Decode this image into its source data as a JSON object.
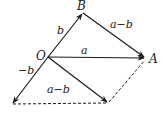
{
  "diagram": {
    "title": "",
    "points": {
      "O": {
        "label": "O",
        "x": 48,
        "y": 57
      },
      "A": {
        "label": "A",
        "x": 145,
        "y": 58
      },
      "B": {
        "label": "B",
        "x": 83,
        "y": 13
      },
      "neg_b_tip": {
        "x": 12,
        "y": 104
      },
      "a_minus_b_tip": {
        "x": 108,
        "y": 103
      }
    },
    "vectors": [
      {
        "from": "O",
        "to": "B",
        "label": "b",
        "style": "solid"
      },
      {
        "from": "O",
        "to": "A",
        "label": "a",
        "style": "solid"
      },
      {
        "from": "B",
        "to": "A",
        "label": "a−b",
        "style": "solid"
      },
      {
        "from": "O",
        "to": "neg_b_tip",
        "label": "−b",
        "style": "solid"
      },
      {
        "from": "O",
        "to": "a_minus_b_tip",
        "label": "a−b",
        "style": "solid"
      }
    ],
    "dashed_lines": [
      {
        "from": "neg_b_tip",
        "to": "a_minus_b_tip"
      },
      {
        "from": "a_minus_b_tip",
        "to": "A"
      }
    ],
    "labels": {
      "O": "O",
      "A": "A",
      "B": "B",
      "vec_b": "b",
      "vec_a": "a",
      "vec_BA": "a−b",
      "vec_neg_b": "−b",
      "vec_a_minus_b": "a−b"
    },
    "colors": {
      "line": "#1a1a1a",
      "background": "#ffffff"
    }
  }
}
